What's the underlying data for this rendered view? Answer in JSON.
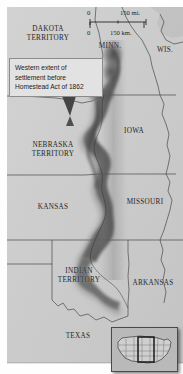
{
  "map": {
    "title": "Western extent of settlement before Homestead Act of 1862",
    "palette": {
      "land_light": "#d2d2d2",
      "land_mid": "#c4c4c4",
      "land_dark": "#bdbdbd",
      "shading_dark": "#4f4f4f",
      "shading_mid": "#8a8a8a",
      "border_line": "#3d3d3d",
      "callout_bg": "#e2e2e2",
      "callout_border": "#8c8c8c",
      "text": "#262626",
      "inset_bg": "#b9b9b9",
      "background": "#ffffff"
    },
    "callout": {
      "text": "Western extent of\nsettlement before\nHomestead Act of 1862",
      "pointer_label": "callout-pointer"
    },
    "scale": {
      "miles_zero": "0",
      "miles_max": "150 mi.",
      "km_zero": "0",
      "km_max": "150 km."
    },
    "labels": [
      {
        "id": "dakota-territory",
        "text": "DAKOTA\nTERRITORY",
        "x": 48,
        "y": 30,
        "kind": "territory"
      },
      {
        "id": "minnesota",
        "text": "MINN.",
        "x": 110,
        "y": 47,
        "kind": "state"
      },
      {
        "id": "wisconsin",
        "text": "WIS.",
        "x": 165,
        "y": 51,
        "kind": "state"
      },
      {
        "id": "nebraska-territory",
        "text": "NEBRASKA\nTERRITORY",
        "x": 53,
        "y": 146,
        "kind": "territory"
      },
      {
        "id": "iowa",
        "text": "IOWA",
        "x": 134,
        "y": 132,
        "kind": "state"
      },
      {
        "id": "kansas",
        "text": "KANSAS",
        "x": 53,
        "y": 208,
        "kind": "state"
      },
      {
        "id": "missouri",
        "text": "MISSOURI",
        "x": 145,
        "y": 203,
        "kind": "state"
      },
      {
        "id": "indian-territory",
        "text": "INDIAN\nTERRITORY",
        "x": 79,
        "y": 272,
        "kind": "territory"
      },
      {
        "id": "arkansas",
        "text": "ARKANSAS",
        "x": 153,
        "y": 284,
        "kind": "state"
      },
      {
        "id": "texas",
        "text": "TEXAS",
        "x": 78,
        "y": 337,
        "kind": "state"
      }
    ],
    "inset": {
      "name": "united-states-locator-inset",
      "highlight_region": "great-plains"
    }
  }
}
